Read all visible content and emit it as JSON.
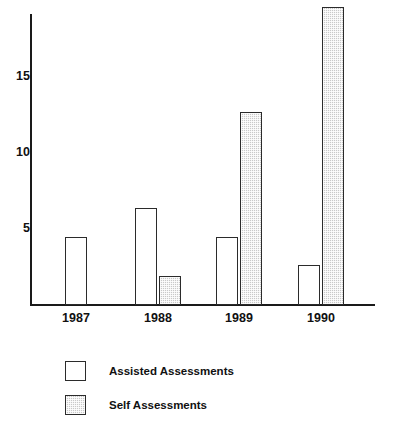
{
  "chart_data": {
    "type": "bar",
    "title": "",
    "subtitle": "",
    "xlabel": "",
    "ylabel": "",
    "categories": [
      "1987",
      "1988",
      "1989",
      "1990"
    ],
    "series": [
      {
        "name": "Assisted Assessments",
        "values": [
          4.5,
          6.4,
          4.5,
          2.6
        ],
        "fill": "white",
        "edge": "#2b2b2b"
      },
      {
        "name": "Self Assessments",
        "values": [
          0,
          1.9,
          12.7,
          19.6
        ],
        "fill": "#c9c9c9",
        "edge": "#2b2b2b"
      }
    ],
    "ylim": [
      0,
      19.8
    ],
    "yticks": [
      5,
      10,
      15
    ],
    "ytick_labels": [
      "5",
      "10",
      "15"
    ],
    "xtick_labels": [
      "1987",
      "1988",
      "1989",
      "1990"
    ],
    "grid": false,
    "legend_position": "below-left",
    "legend_entries": [
      {
        "label": "Assisted Assessments",
        "swatch": "assisted"
      },
      {
        "label": "Self Assessments",
        "swatch": "self"
      }
    ],
    "axis_color": "#1a1a1a",
    "background": "#ffffff"
  },
  "layout": {
    "plot_left": 30,
    "plot_baseline": 305,
    "plot_top": 14,
    "px_per_unit": 15.2,
    "group_centers": [
      76,
      158,
      239,
      321
    ],
    "bar_width": 22,
    "bar_gap": 2
  }
}
